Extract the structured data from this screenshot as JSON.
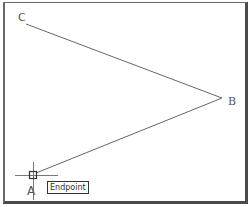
{
  "viewport": {
    "background": "#ffffff",
    "frame_color": "#6a6a6a",
    "line_color": "#666666"
  },
  "points": {
    "A": {
      "label": "A",
      "x": 34,
      "y": 174
    },
    "B": {
      "label": "B",
      "x": 222,
      "y": 98
    },
    "C": {
      "label": "C",
      "x": 26,
      "y": 24
    }
  },
  "lines": [
    {
      "from": "C",
      "to": "B"
    },
    {
      "from": "B",
      "to": "A"
    }
  ],
  "cursor": {
    "type": "crosshair",
    "x": 33,
    "y": 175
  },
  "snap": {
    "marker": "endpoint-square",
    "tooltip": "Endpoint"
  }
}
